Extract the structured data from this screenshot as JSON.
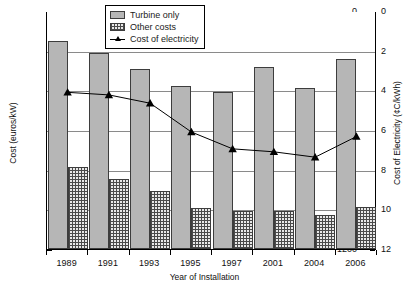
{
  "chart_data": {
    "type": "bar",
    "title": "",
    "xlabel": "Year of Installation",
    "ylabel": "Cost (euros/kW)",
    "y2label": "Cost of Electricity (¢C/kWh)",
    "categories": [
      "1989",
      "1991",
      "1993",
      "1995",
      "1997",
      "2001",
      "2004",
      "2006"
    ],
    "ylim": [
      0,
      1200
    ],
    "yticks": [
      0,
      200,
      400,
      600,
      800,
      1000,
      1200
    ],
    "yminor_step": 100,
    "y2lim": [
      0,
      12
    ],
    "y2ticks": [
      0,
      2,
      4,
      6,
      8,
      10,
      12
    ],
    "y2minor_step": 1,
    "grid": true,
    "legend_position": "top-center",
    "series": [
      {
        "name": "Turbine only",
        "kind": "bar",
        "axis": "left",
        "color": "#b6b6b6",
        "values": [
          1050,
          988,
          908,
          820,
          790,
          920,
          810,
          958
        ]
      },
      {
        "name": "Other costs",
        "kind": "bar",
        "axis": "left",
        "color": "#e8e8e8",
        "values": [
          415,
          352,
          295,
          207,
          192,
          190,
          170,
          213
        ]
      },
      {
        "name": "Cost of electricity",
        "kind": "line",
        "axis": "right",
        "color": "#000000",
        "marker": "triangle",
        "values": [
          7.95,
          7.82,
          7.4,
          5.95,
          5.1,
          4.95,
          4.68,
          5.72
        ]
      }
    ]
  },
  "axes": {
    "left_ticks": [
      "1200",
      "1000",
      "800",
      "600",
      "400",
      "200",
      "0"
    ],
    "right_ticks": [
      "12",
      "10",
      "8",
      "6",
      "4",
      "2",
      "0"
    ],
    "x_ticks": [
      "1989",
      "1991",
      "1993",
      "1995",
      "1997",
      "2001",
      "2004",
      "2006"
    ],
    "left_title": "Cost (euros/kW)",
    "right_title": "Cost of Electricity (¢C/kWh)",
    "bottom_title": "Year of Installation"
  },
  "legend": {
    "items": [
      {
        "label": "Turbine only"
      },
      {
        "label": "Other costs"
      },
      {
        "label": "Cost of electricity"
      }
    ]
  }
}
